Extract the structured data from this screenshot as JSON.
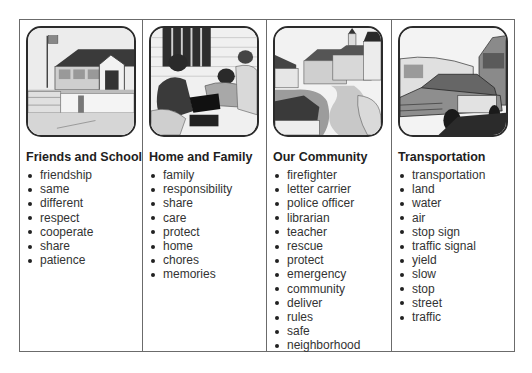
{
  "columns": [
    {
      "image": "school-building-illustration",
      "heading": "Friends and School",
      "words": [
        "friendship",
        "same",
        "different",
        "respect",
        "cooperate",
        "share",
        "patience"
      ]
    },
    {
      "image": "family-playing-game-illustration",
      "heading": "Home and Family",
      "words": [
        "family",
        "responsibility",
        "share",
        "care",
        "protect",
        "home",
        "chores",
        "memories"
      ]
    },
    {
      "image": "town-street-illustration",
      "heading": "Our Community",
      "words": [
        "firefighter",
        "letter carrier",
        "police officer",
        "librarian",
        "teacher",
        "rescue",
        "protect",
        "emergency",
        "community",
        "deliver",
        "rules",
        "safe",
        "neighborhood"
      ]
    },
    {
      "image": "cars-and-bus-illustration",
      "heading": "Transportation",
      "words": [
        "transportation",
        "land",
        "water",
        "air",
        "stop sign",
        "traffic signal",
        "yield",
        "slow",
        "stop",
        "street",
        "traffic"
      ]
    }
  ]
}
